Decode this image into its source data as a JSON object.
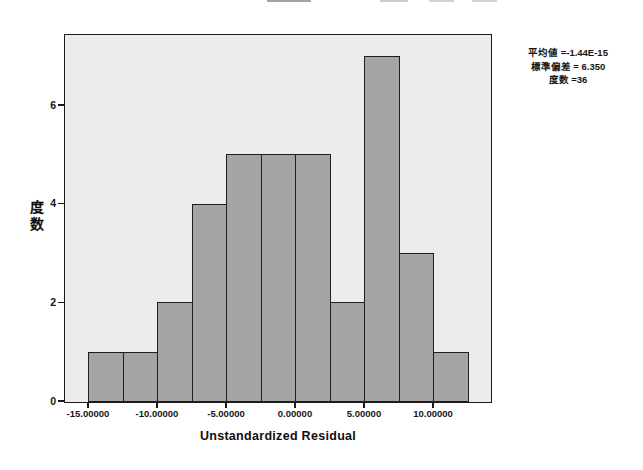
{
  "page": {
    "background": "#ffffff"
  },
  "stats_box": {
    "lines": [
      "平均値 =-1.44E-15",
      "標準偏差 = 6.350",
      "度数 =36"
    ]
  },
  "chart_data": {
    "type": "bar",
    "subtype": "histogram",
    "title": "",
    "xlabel": "Unstandardized Residual",
    "ylabel": "度数",
    "bin_edges": [
      -15,
      -12.5,
      -10,
      -7.5,
      -5,
      -2.5,
      0,
      2.5,
      5,
      7.5,
      10,
      12.5
    ],
    "counts": [
      1,
      1,
      2,
      4,
      5,
      5,
      5,
      2,
      7,
      3,
      1
    ],
    "x_ticks": [
      {
        "value": -15,
        "label": "-15.00000"
      },
      {
        "value": -10,
        "label": "-10.00000"
      },
      {
        "value": -5,
        "label": "-5.00000"
      },
      {
        "value": 0,
        "label": "0.00000"
      },
      {
        "value": 5,
        "label": "5.00000"
      },
      {
        "value": 10,
        "label": "10.00000"
      }
    ],
    "y_ticks": [
      {
        "value": 0,
        "label": "0"
      },
      {
        "value": 2,
        "label": "2"
      },
      {
        "value": 4,
        "label": "4"
      },
      {
        "value": 6,
        "label": "6"
      }
    ],
    "xlim": [
      -16.7,
      13.9
    ],
    "ylim": [
      0,
      7.42
    ],
    "grid": false,
    "legend_position": "none",
    "annotations": {
      "mean": "-1.44E-15",
      "std_dev": "6.350",
      "n": "36"
    },
    "colors": {
      "bar_fill": "#a5a5a5",
      "bar_border": "#1f1f1f",
      "plot_bg": "#ececec",
      "frame": "#1a1a1a",
      "page_bg": "#ffffff"
    }
  },
  "artifacts": {
    "cropped_title_fragments": [
      {
        "x": 267,
        "w": 44,
        "opacity": 0.7
      },
      {
        "x": 380,
        "w": 28,
        "opacity": 0.4
      },
      {
        "x": 429,
        "w": 25,
        "opacity": 0.35
      },
      {
        "x": 472,
        "w": 25,
        "opacity": 0.35
      }
    ]
  }
}
